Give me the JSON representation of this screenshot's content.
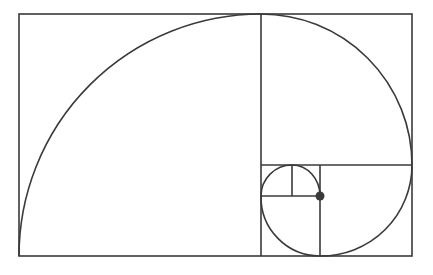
{
  "diagram": {
    "colors": {
      "stroke": "#3a3a3a",
      "background": "#ffffff",
      "center_dot": "#3a3a3a"
    },
    "outer_rect": {
      "x": 19,
      "y": 14,
      "w": 393,
      "h": 242
    },
    "dividers": [
      {
        "x1": 261,
        "y1": 14,
        "x2": 261,
        "y2": 256
      },
      {
        "x1": 261,
        "y1": 165,
        "x2": 412,
        "y2": 165
      },
      {
        "x1": 320,
        "y1": 165,
        "x2": 320,
        "y2": 256
      },
      {
        "x1": 261,
        "y1": 196,
        "x2": 320,
        "y2": 196
      },
      {
        "x1": 292,
        "y1": 165,
        "x2": 292,
        "y2": 196
      }
    ],
    "center_dot": {
      "cx": 320,
      "cy": 196,
      "r": 4.5
    }
  }
}
